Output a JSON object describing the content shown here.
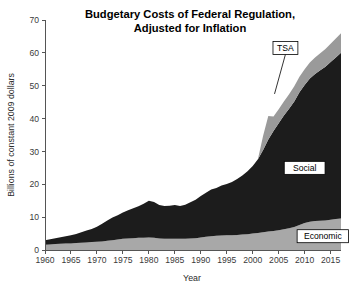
{
  "chart_data": {
    "type": "area",
    "title": "Budgetary Costs of Federal Regulation, Adjusted for Inflation",
    "title_line1": "Budgetary Costs of Federal Regulation,",
    "title_line2": "Adjusted for Inflation",
    "xlabel": "Year",
    "ylabel": "Billions of constant 2009 dollars",
    "xlim": [
      1960,
      2017
    ],
    "ylim": [
      0,
      70
    ],
    "ytick_labels": [
      "0",
      "10",
      "20",
      "30",
      "40",
      "50",
      "60",
      "70"
    ],
    "yticks": [
      0,
      10,
      20,
      30,
      40,
      50,
      60,
      70
    ],
    "xtick_labels": [
      "1960",
      "1965",
      "1970",
      "1975",
      "1980",
      "1985",
      "1990",
      "1995",
      "2000",
      "2005",
      "2010",
      "2015"
    ],
    "xticks": [
      1960,
      1965,
      1970,
      1975,
      1980,
      1985,
      1990,
      1995,
      2000,
      2005,
      2010,
      2015
    ],
    "grid": false,
    "legend_position": "inline-annotations",
    "stacked": true,
    "x": [
      1960,
      1961,
      1962,
      1963,
      1964,
      1965,
      1966,
      1967,
      1968,
      1969,
      1970,
      1971,
      1972,
      1973,
      1974,
      1975,
      1976,
      1977,
      1978,
      1979,
      1980,
      1981,
      1982,
      1983,
      1984,
      1985,
      1986,
      1987,
      1988,
      1989,
      1990,
      1991,
      1992,
      1993,
      1994,
      1995,
      1996,
      1997,
      1998,
      1999,
      2000,
      2001,
      2002,
      2003,
      2004,
      2005,
      2006,
      2007,
      2008,
      2009,
      2010,
      2011,
      2012,
      2013,
      2014,
      2015,
      2016,
      2017
    ],
    "series": [
      {
        "name": "Economic",
        "color": "#a8a8a8",
        "label": "Economic",
        "values": [
          1.6,
          1.7,
          1.8,
          1.9,
          2.0,
          2.0,
          2.1,
          2.2,
          2.3,
          2.4,
          2.5,
          2.6,
          2.8,
          3.0,
          3.2,
          3.4,
          3.5,
          3.6,
          3.7,
          3.7,
          3.8,
          3.7,
          3.5,
          3.4,
          3.4,
          3.4,
          3.4,
          3.4,
          3.5,
          3.6,
          3.8,
          4.0,
          4.2,
          4.3,
          4.4,
          4.5,
          4.5,
          4.6,
          4.7,
          4.8,
          5.0,
          5.2,
          5.4,
          5.6,
          5.8,
          6.0,
          6.3,
          6.6,
          7.0,
          7.6,
          8.2,
          8.6,
          8.8,
          8.9,
          9.0,
          9.2,
          9.4,
          9.6
        ]
      },
      {
        "name": "Social",
        "color": "#1c1c1c",
        "label": "Social",
        "values": [
          1.4,
          1.6,
          1.8,
          2.0,
          2.2,
          2.5,
          2.8,
          3.2,
          3.6,
          4.0,
          4.6,
          5.4,
          6.2,
          6.9,
          7.4,
          8.0,
          8.6,
          9.1,
          9.6,
          10.4,
          11.2,
          10.9,
          10.2,
          10.0,
          10.1,
          10.3,
          10.0,
          10.4,
          11.0,
          11.7,
          12.6,
          13.4,
          14.2,
          14.6,
          15.2,
          15.6,
          16.2,
          17.0,
          18.0,
          19.2,
          20.6,
          22.4,
          25.0,
          28.0,
          30.4,
          32.6,
          34.6,
          36.4,
          38.2,
          40.4,
          42.0,
          43.6,
          44.8,
          45.8,
          46.8,
          48.0,
          49.2,
          50.4
        ]
      },
      {
        "name": "TSA",
        "color": "#9a9a9a",
        "label": "TSA",
        "values": [
          0,
          0,
          0,
          0,
          0,
          0,
          0,
          0,
          0,
          0,
          0,
          0,
          0,
          0,
          0,
          0,
          0,
          0,
          0,
          0,
          0,
          0,
          0,
          0,
          0,
          0,
          0,
          0,
          0,
          0,
          0,
          0,
          0,
          0,
          0,
          0,
          0,
          0,
          0,
          0,
          0,
          0,
          4.4,
          7.2,
          4.4,
          4.2,
          4.3,
          4.4,
          4.6,
          4.7,
          4.8,
          4.9,
          5.0,
          5.2,
          5.4,
          5.6,
          5.8,
          6.0
        ]
      }
    ],
    "annotations": [
      {
        "text": "TSA",
        "x": 2006.3,
        "y": 61.5,
        "target_x": 2004.2,
        "target_y": 47.5,
        "boxed": true
      },
      {
        "text": "Social",
        "x": 2010.0,
        "y": 25.0,
        "boxed": true
      },
      {
        "text": "Economic",
        "x": 2013.5,
        "y": 4.2,
        "boxed": true
      }
    ]
  }
}
